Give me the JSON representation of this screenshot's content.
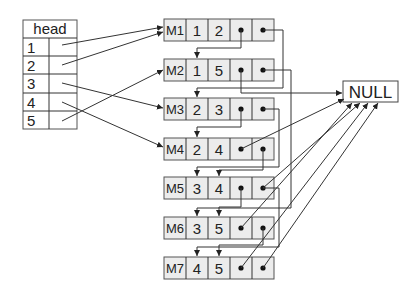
{
  "head_table": {
    "title": "head",
    "rows": [
      "1",
      "2",
      "3",
      "4",
      "5"
    ]
  },
  "nodes": [
    {
      "id": "M1",
      "a": "1",
      "b": "2"
    },
    {
      "id": "M2",
      "a": "1",
      "b": "5"
    },
    {
      "id": "M3",
      "a": "2",
      "b": "3"
    },
    {
      "id": "M4",
      "a": "2",
      "b": "4"
    },
    {
      "id": "M5",
      "a": "3",
      "b": "4"
    },
    {
      "id": "M6",
      "a": "3",
      "b": "5"
    },
    {
      "id": "M7",
      "a": "4",
      "b": "5"
    }
  ],
  "null_label": "NULL",
  "colors": {
    "cell_fill": "#ececec",
    "stroke": "#555555",
    "line": "#333333"
  }
}
